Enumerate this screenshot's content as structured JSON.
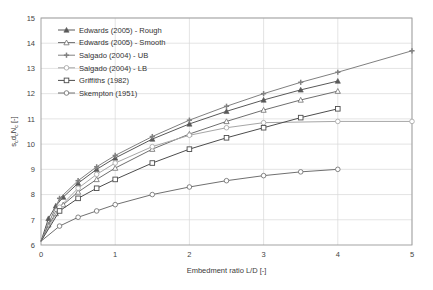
{
  "chart_data": {
    "type": "line",
    "title": "",
    "xlabel": "Embedment ratio L/D [-]",
    "ylabel": "s_c d_c N_c [-]",
    "ylabel_parts": {
      "s": "s",
      "sub1": "c",
      "d": "d",
      "sub2": "c",
      "n": "N",
      "sub3": "c",
      "units": " [-]"
    },
    "xlim": [
      0,
      5
    ],
    "ylim": [
      6,
      15
    ],
    "xticks": [
      0,
      1,
      2,
      3,
      4,
      5
    ],
    "yticks": [
      6,
      7,
      8,
      9,
      10,
      11,
      12,
      13,
      14,
      15
    ],
    "xtick_labels": [
      "0",
      "1",
      "2",
      "3",
      "4",
      "5"
    ],
    "ytick_labels": [
      "6",
      "7",
      "8",
      "9",
      "10",
      "11",
      "12",
      "13",
      "14",
      "15"
    ],
    "grid": true,
    "grid_color": "#d9d9d9",
    "axis_color": "#9a9a9a",
    "legend_position": "upper-left",
    "series": [
      {
        "name": "Edwards (2005) - Rough",
        "marker": "filled-triangle",
        "color": "#595959",
        "x": [
          0,
          0.1,
          0.2,
          0.3,
          0.5,
          0.75,
          1.0,
          1.5,
          2.0,
          2.5,
          3.0,
          3.5,
          4.0
        ],
        "y": [
          6.15,
          7.05,
          7.55,
          7.9,
          8.45,
          9.0,
          9.45,
          10.2,
          10.8,
          11.3,
          11.75,
          12.15,
          12.5
        ]
      },
      {
        "name": "Edwards (2005) - Smooth",
        "marker": "open-triangle",
        "color": "#6e6e6e",
        "x": [
          0,
          0.1,
          0.2,
          0.3,
          0.5,
          0.75,
          1.0,
          1.5,
          2.0,
          2.5,
          3.0,
          3.5,
          4.0
        ],
        "y": [
          6.15,
          6.8,
          7.25,
          7.6,
          8.1,
          8.6,
          9.05,
          9.8,
          10.4,
          10.9,
          11.35,
          11.75,
          12.1
        ]
      },
      {
        "name": "Salgado (2004) - UB",
        "marker": "filled-plus",
        "color": "#808080",
        "x": [
          0,
          0.25,
          0.5,
          0.75,
          1.0,
          1.5,
          2.0,
          2.5,
          3.0,
          3.5,
          4.0,
          5.0
        ],
        "y": [
          6.15,
          7.85,
          8.55,
          9.1,
          9.55,
          10.3,
          10.95,
          11.5,
          12.0,
          12.45,
          12.85,
          13.7
        ]
      },
      {
        "name": "Salgado (2004) - LB",
        "marker": "open-circle",
        "color": "#a6a6a6",
        "x": [
          0,
          0.25,
          0.5,
          0.75,
          1.0,
          1.5,
          2.0,
          2.5,
          3.0,
          4.0,
          5.0
        ],
        "y": [
          6.15,
          7.5,
          8.25,
          8.8,
          9.25,
          9.9,
          10.35,
          10.65,
          10.85,
          10.9,
          10.9
        ]
      },
      {
        "name": "Griffiths (1982)",
        "marker": "open-square",
        "color": "#4d4d4d",
        "x": [
          0,
          0.25,
          0.5,
          0.75,
          1.0,
          1.5,
          2.0,
          2.5,
          3.0,
          3.5,
          4.0
        ],
        "y": [
          6.15,
          7.35,
          7.85,
          8.25,
          8.6,
          9.25,
          9.8,
          10.25,
          10.65,
          11.05,
          11.4
        ]
      },
      {
        "name": "Skempton (1951)",
        "marker": "open-circle",
        "color": "#707070",
        "x": [
          0,
          0.25,
          0.5,
          0.75,
          1.0,
          1.5,
          2.0,
          2.5,
          3.0,
          3.5,
          4.0
        ],
        "y": [
          6.15,
          6.75,
          7.1,
          7.35,
          7.6,
          8.0,
          8.3,
          8.55,
          8.75,
          8.9,
          9.0
        ]
      }
    ]
  },
  "legend": {
    "items": [
      {
        "label": "Edwards (2005) - Rough"
      },
      {
        "label": "Edwards (2005) - Smooth"
      },
      {
        "label": "Salgado (2004) - UB"
      },
      {
        "label": "Salgado (2004) - LB"
      },
      {
        "label": "Griffiths (1982)"
      },
      {
        "label": "Skempton (1951)"
      }
    ]
  }
}
